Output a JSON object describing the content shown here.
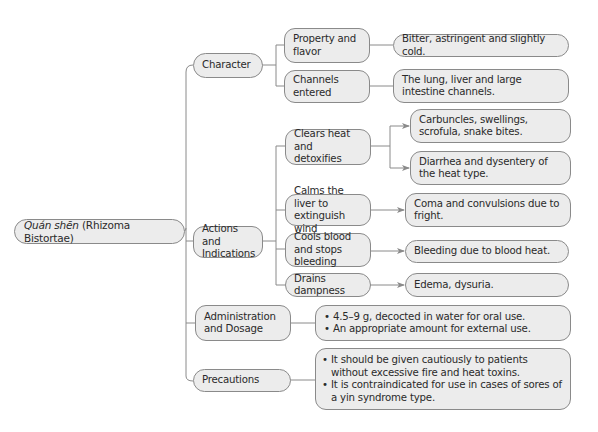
{
  "root": {
    "title_italic": "Quán shēn",
    "title_rest": " (Rhizoma Bistortae)"
  },
  "branches": {
    "character": {
      "label": "Character",
      "children": [
        {
          "label": "Property and flavor",
          "detail": "Bitter, astringent and slightly cold."
        },
        {
          "label": "Channels entered",
          "detail": "The lung, liver and large intestine channels."
        }
      ]
    },
    "actions": {
      "label": "Actions and Indications",
      "children": [
        {
          "label": "Clears heat and detoxifies",
          "details": [
            "Carbuncles, swellings, scrofula, snake bites.",
            "Diarrhea and dysentery of the heat type."
          ]
        },
        {
          "label": "Calms the liver to extinguish wind",
          "details": [
            "Coma and convulsions due to fright."
          ]
        },
        {
          "label": "Cools blood and stops bleeding",
          "details": [
            "Bleeding due to blood heat."
          ]
        },
        {
          "label": "Drains dampness",
          "details": [
            "Edema, dysuria."
          ]
        }
      ]
    },
    "administration": {
      "label": "Administration and Dosage",
      "bullets": [
        "4.5–9 g, decocted in water for oral use.",
        "An appropriate amount for external use."
      ]
    },
    "precautions": {
      "label": "Precautions",
      "bullets": [
        "It should be given cautiously to patients without excessive fire and heat toxins.",
        "It is contraindicated for use in cases of sores of a yin syndrome type."
      ]
    }
  },
  "colors": {
    "node_fill": "#ececec",
    "node_border": "#8a8a8a",
    "connector": "#8a8a8a",
    "text": "#2a2a2a"
  }
}
